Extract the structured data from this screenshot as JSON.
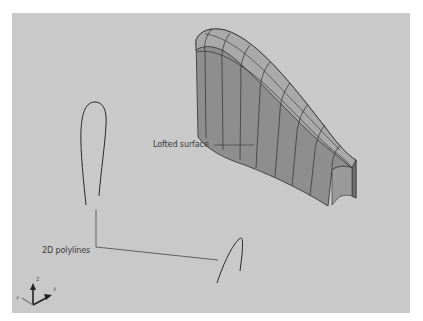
{
  "figure": {
    "type": "3d-viewport-illustration",
    "viewport_background": "#c9c9c9",
    "surface_color": "#8f8f8f",
    "line_color": "#2e2e2e"
  },
  "annotations": {
    "lofted_surface": "Lofted surface",
    "polylines": "2D polylines"
  },
  "ucs_icon": {
    "z_label": "Z",
    "x_label": "X",
    "y_label": "Y"
  }
}
